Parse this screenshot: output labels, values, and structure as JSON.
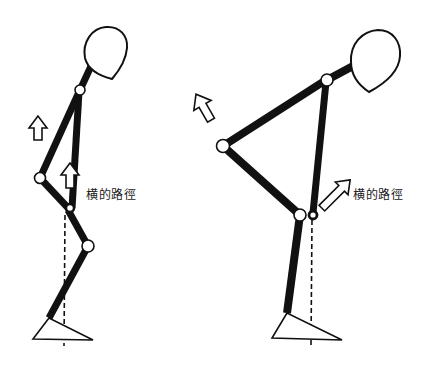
{
  "diagram": {
    "type": "biomechanics-lifting-posture",
    "figures": [
      {
        "id": "squat-lift",
        "label": "横的路徑",
        "label_position": {
          "x": 86,
          "y": 185
        },
        "colors": {
          "limb": "#111111",
          "outline": "#111111",
          "joint_fill": "#ffffff"
        }
      },
      {
        "id": "stoop-lift",
        "label": "横的路徑",
        "label_position": {
          "x": 353,
          "y": 185
        },
        "colors": {
          "limb": "#111111",
          "outline": "#111111",
          "joint_fill": "#ffffff"
        }
      }
    ]
  }
}
